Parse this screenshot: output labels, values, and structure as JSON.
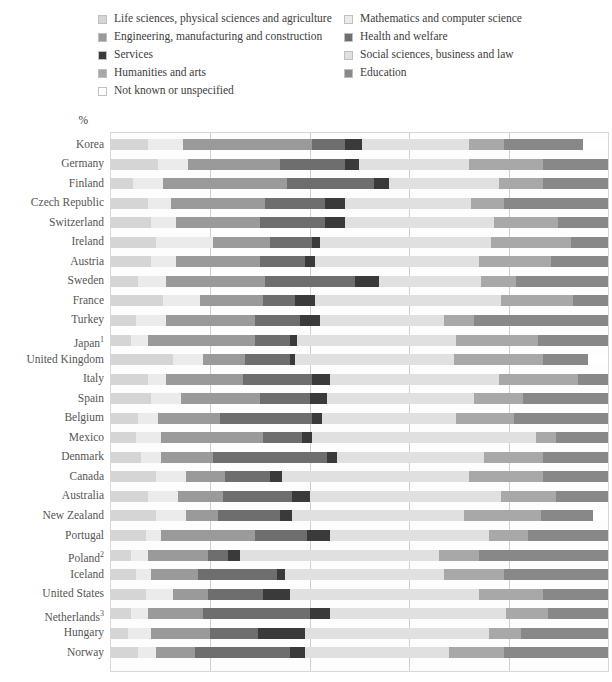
{
  "legend": {
    "rows": [
      [
        {
          "label": "Life sciences, physical sciences and agriculture",
          "key": "life",
          "color": "#d5d5d5"
        },
        {
          "label": "Mathematics and computer science",
          "key": "math",
          "color": "#ebebeb"
        }
      ],
      [
        {
          "label": "Engineering, manufacturing and construction",
          "key": "eng",
          "color": "#9a9a9a"
        },
        {
          "label": "Health and welfare",
          "key": "health",
          "color": "#6e6e6e"
        }
      ],
      [
        {
          "label": "Services",
          "key": "serv",
          "color": "#3a3a3a"
        },
        {
          "label": "Social sciences, business and law",
          "key": "social",
          "color": "#e0e0e0"
        }
      ],
      [
        {
          "label": "Humanities and arts",
          "key": "hum",
          "color": "#a8a8a8"
        },
        {
          "label": "Education",
          "key": "edu",
          "color": "#888888"
        }
      ],
      [
        {
          "label": "Not known or unspecified",
          "key": "unknown",
          "color": "#ffffff"
        }
      ]
    ]
  },
  "axis": {
    "percent_symbol": "%",
    "ticks": [
      0,
      20,
      40,
      60,
      80,
      100
    ],
    "tick_labels": [
      "0",
      "20",
      "40",
      "60",
      "80",
      "100"
    ]
  },
  "chart_data": {
    "type": "bar",
    "orientation": "horizontal",
    "stacked": true,
    "title": "",
    "xlabel": "%",
    "ylabel": "",
    "xlim": [
      0,
      100
    ],
    "grid": true,
    "legend_position": "top",
    "series": [
      {
        "name": "Life sciences, physical sciences and agriculture",
        "key": "life",
        "color": "#d5d5d5"
      },
      {
        "name": "Mathematics and computer science",
        "key": "math",
        "color": "#ebebeb"
      },
      {
        "name": "Engineering, manufacturing and construction",
        "key": "eng",
        "color": "#9a9a9a"
      },
      {
        "name": "Health and welfare",
        "key": "health",
        "color": "#6e6e6e"
      },
      {
        "name": "Services",
        "key": "serv",
        "color": "#3a3a3a"
      },
      {
        "name": "Social sciences, business and law",
        "key": "social",
        "color": "#e0e0e0"
      },
      {
        "name": "Humanities and arts",
        "key": "hum",
        "color": "#a8a8a8"
      },
      {
        "name": "Education",
        "key": "edu",
        "color": "#888888"
      },
      {
        "name": "Not known or unspecified",
        "key": "unknown",
        "color": "#ffffff"
      }
    ],
    "categories": [
      "Korea",
      "Germany",
      "Finland",
      "Czech Republic",
      "Switzerland",
      "Ireland",
      "Austria",
      "Sweden",
      "France",
      "Turkey",
      "Japan",
      "United Kingdom",
      "Italy",
      "Spain",
      "Belgium",
      "Mexico",
      "Denmark",
      "Canada",
      "Australia",
      "New Zealand",
      "Portugal",
      "Poland",
      "Iceland",
      "United States",
      "Netherlands",
      "Hungary",
      "Norway"
    ],
    "category_labels": [
      "Korea",
      "Germany",
      "Finland",
      "Czech Republic",
      "Switzerland",
      "Ireland",
      "Austria",
      "Sweden",
      "France",
      "Turkey",
      "Japan¹",
      "United Kingdom",
      "Italy",
      "Spain",
      "Belgium",
      "Mexico",
      "Denmark",
      "Canada",
      "Australia",
      "New Zealand",
      "Portugal",
      "Poland²",
      "Iceland",
      "United States",
      "Netherlands³",
      "Hungary",
      "Norway"
    ],
    "rows": [
      {
        "country": "Korea",
        "values": {
          "life": 7.5,
          "math": 7.0,
          "eng": 26.0,
          "health": 6.5,
          "serv": 3.5,
          "social": 21.5,
          "hum": 7.0,
          "edu": 16.0,
          "unknown": 5.0
        }
      },
      {
        "country": "Germany",
        "values": {
          "life": 9.5,
          "math": 6.0,
          "eng": 18.5,
          "health": 13.0,
          "serv": 3.0,
          "social": 22.0,
          "hum": 15.0,
          "edu": 13.0,
          "unknown": 0.0
        }
      },
      {
        "country": "Finland",
        "values": {
          "life": 4.5,
          "math": 6.0,
          "eng": 25.0,
          "health": 17.5,
          "serv": 3.0,
          "social": 22.0,
          "hum": 9.0,
          "edu": 13.0,
          "unknown": 0.0
        }
      },
      {
        "country": "Czech Republic",
        "values": {
          "life": 7.5,
          "math": 4.5,
          "eng": 19.0,
          "health": 12.0,
          "serv": 4.0,
          "social": 25.5,
          "hum": 6.5,
          "edu": 21.0,
          "unknown": 0.0
        }
      },
      {
        "country": "Switzerland",
        "values": {
          "life": 8.0,
          "math": 5.0,
          "eng": 17.0,
          "health": 13.0,
          "serv": 4.0,
          "social": 30.0,
          "hum": 13.0,
          "edu": 10.0,
          "unknown": 0.0
        }
      },
      {
        "country": "Ireland",
        "values": {
          "life": 9.0,
          "math": 11.5,
          "eng": 11.5,
          "health": 8.5,
          "serv": 1.5,
          "social": 34.5,
          "hum": 16.0,
          "edu": 7.5,
          "unknown": 0.0
        }
      },
      {
        "country": "Austria",
        "values": {
          "life": 8.0,
          "math": 5.0,
          "eng": 17.0,
          "health": 9.0,
          "serv": 2.0,
          "social": 33.0,
          "hum": 14.5,
          "edu": 11.5,
          "unknown": 0.0
        }
      },
      {
        "country": "Sweden",
        "values": {
          "life": 5.5,
          "math": 5.5,
          "eng": 20.0,
          "health": 18.0,
          "serv": 5.0,
          "social": 20.5,
          "hum": 7.0,
          "edu": 18.5,
          "unknown": 0.0
        }
      },
      {
        "country": "France",
        "values": {
          "life": 10.5,
          "math": 7.5,
          "eng": 12.5,
          "health": 6.5,
          "serv": 4.0,
          "social": 37.5,
          "hum": 14.5,
          "edu": 7.0,
          "unknown": 0.0
        }
      },
      {
        "country": "Turkey",
        "values": {
          "life": 5.0,
          "math": 6.0,
          "eng": 18.0,
          "health": 9.0,
          "serv": 4.0,
          "social": 25.0,
          "hum": 6.0,
          "edu": 27.0,
          "unknown": 0.0
        }
      },
      {
        "country": "Japan",
        "values": {
          "life": 4.0,
          "math": 3.5,
          "eng": 21.5,
          "health": 7.0,
          "serv": 1.5,
          "social": 32.0,
          "hum": 16.5,
          "edu": 14.0,
          "unknown": 0.0
        }
      },
      {
        "country": "United Kingdom",
        "values": {
          "life": 12.5,
          "math": 6.0,
          "eng": 8.5,
          "health": 9.0,
          "serv": 1.0,
          "social": 32.0,
          "hum": 18.0,
          "edu": 9.0,
          "unknown": 4.0
        }
      },
      {
        "country": "Italy",
        "values": {
          "life": 7.5,
          "math": 3.5,
          "eng": 15.5,
          "health": 14.0,
          "serv": 3.5,
          "social": 34.0,
          "hum": 16.0,
          "edu": 6.0,
          "unknown": 0.0
        }
      },
      {
        "country": "Spain",
        "values": {
          "life": 8.0,
          "math": 6.0,
          "eng": 16.0,
          "health": 10.0,
          "serv": 3.5,
          "social": 29.5,
          "hum": 10.0,
          "edu": 17.0,
          "unknown": 0.0
        }
      },
      {
        "country": "Belgium",
        "values": {
          "life": 5.5,
          "math": 4.0,
          "eng": 12.5,
          "health": 18.5,
          "serv": 2.0,
          "social": 27.0,
          "hum": 11.5,
          "edu": 19.0,
          "unknown": 0.0
        }
      },
      {
        "country": "Mexico",
        "values": {
          "life": 5.0,
          "math": 5.0,
          "eng": 20.5,
          "health": 8.0,
          "serv": 2.0,
          "social": 45.0,
          "hum": 4.0,
          "edu": 10.5,
          "unknown": 0.0
        }
      },
      {
        "country": "Denmark",
        "values": {
          "life": 6.0,
          "math": 4.0,
          "eng": 10.5,
          "health": 23.0,
          "serv": 2.0,
          "social": 29.5,
          "hum": 12.0,
          "edu": 13.0,
          "unknown": 0.0
        }
      },
      {
        "country": "Canada",
        "values": {
          "life": 9.0,
          "math": 6.0,
          "eng": 8.0,
          "health": 9.0,
          "serv": 2.5,
          "social": 37.5,
          "hum": 15.0,
          "edu": 13.0,
          "unknown": 0.0
        }
      },
      {
        "country": "Australia",
        "values": {
          "life": 7.5,
          "math": 6.0,
          "eng": 9.0,
          "health": 14.0,
          "serv": 3.5,
          "social": 38.5,
          "hum": 11.0,
          "edu": 10.5,
          "unknown": 0.0
        }
      },
      {
        "country": "New Zealand",
        "values": {
          "life": 9.0,
          "math": 6.0,
          "eng": 6.5,
          "health": 12.5,
          "serv": 2.5,
          "social": 34.5,
          "hum": 15.5,
          "edu": 10.5,
          "unknown": 3.0
        }
      },
      {
        "country": "Portugal",
        "values": {
          "life": 7.0,
          "math": 3.0,
          "eng": 19.0,
          "health": 10.5,
          "serv": 4.5,
          "social": 32.0,
          "hum": 8.0,
          "edu": 16.0,
          "unknown": 0.0
        }
      },
      {
        "country": "Poland",
        "values": {
          "life": 4.0,
          "math": 3.5,
          "eng": 12.0,
          "health": 4.0,
          "serv": 2.5,
          "social": 40.0,
          "hum": 8.0,
          "edu": 26.0,
          "unknown": 0.0
        }
      },
      {
        "country": "Iceland",
        "values": {
          "life": 5.0,
          "math": 3.0,
          "eng": 9.5,
          "health": 16.0,
          "serv": 1.5,
          "social": 32.0,
          "hum": 12.0,
          "edu": 21.0,
          "unknown": 0.0
        }
      },
      {
        "country": "United States",
        "values": {
          "life": 7.0,
          "math": 5.5,
          "eng": 7.0,
          "health": 11.0,
          "serv": 5.5,
          "social": 38.0,
          "hum": 13.0,
          "edu": 13.0,
          "unknown": 0.0
        }
      },
      {
        "country": "Netherlands",
        "values": {
          "life": 4.0,
          "math": 3.5,
          "eng": 11.0,
          "health": 21.5,
          "serv": 4.0,
          "social": 35.5,
          "hum": 8.5,
          "edu": 12.0,
          "unknown": 0.0
        }
      },
      {
        "country": "Hungary",
        "values": {
          "life": 3.5,
          "math": 4.5,
          "eng": 12.0,
          "health": 9.5,
          "serv": 9.5,
          "social": 37.0,
          "hum": 6.5,
          "edu": 17.5,
          "unknown": 0.0
        }
      },
      {
        "country": "Norway",
        "values": {
          "life": 5.5,
          "math": 3.5,
          "eng": 8.0,
          "health": 19.0,
          "serv": 3.0,
          "social": 29.0,
          "hum": 11.0,
          "edu": 21.0,
          "unknown": 0.0
        }
      }
    ]
  }
}
